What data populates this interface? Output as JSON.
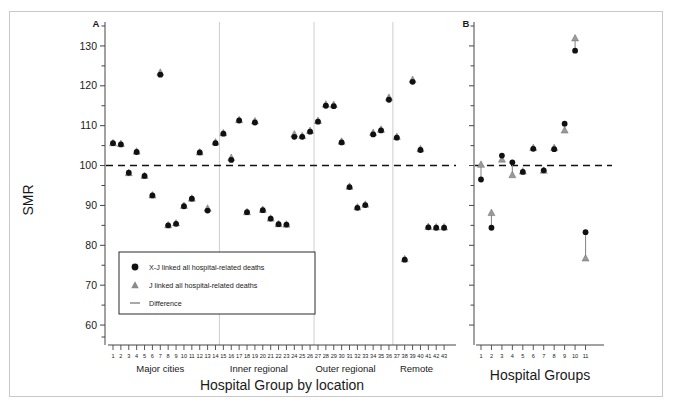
{
  "figure": {
    "background": "#ffffff",
    "frame_color": "#c9c9c9"
  },
  "axis": {
    "ylabel": "SMR",
    "ytick_labels": [
      "130",
      "120",
      "110",
      "100",
      "90",
      "80",
      "70",
      "60"
    ],
    "ytick_values": [
      130,
      120,
      110,
      100,
      90,
      80,
      70,
      60
    ],
    "ylim": [
      55,
      136
    ],
    "reference_line_value": 100
  },
  "panels": [
    {
      "letter": "A",
      "xlabel": "Hospital Group by location",
      "group_labels": [
        "Major cities",
        "Inner regional",
        "Outer regional",
        "Remote"
      ],
      "xtick_labels": [
        "1",
        "2",
        "3",
        "4",
        "5",
        "6",
        "7",
        "8",
        "9",
        "10",
        "11",
        "12",
        "13",
        "14",
        "15",
        "16",
        "17",
        "18",
        "19",
        "20",
        "21",
        "22",
        "23",
        "24",
        "25",
        "26",
        "27",
        "28",
        "29",
        "30",
        "31",
        "32",
        "33",
        "34",
        "35",
        "36",
        "37",
        "38",
        "39",
        "40",
        "41",
        "42",
        "43"
      ]
    },
    {
      "letter": "B",
      "xlabel": "Hospital Groups",
      "xtick_labels": [
        "1",
        "2",
        "3",
        "4",
        "5",
        "6",
        "7",
        "8",
        "9",
        "10",
        "11"
      ]
    }
  ],
  "legend": {
    "items": [
      {
        "marker": "circle",
        "color": "#111111",
        "label": "X-J linked all hospital-related deaths"
      },
      {
        "marker": "triangle",
        "color": "#8a8a8a",
        "label": "J linked all hospital-related deaths"
      },
      {
        "marker": "line",
        "color": "#7a7a7a",
        "label": "Difference"
      }
    ]
  },
  "colors": {
    "circle_marker": "#111111",
    "triangle_marker": "#9a9a9a",
    "difference_line": "#8c8c8c",
    "reference_line": "#111111",
    "separator_line": "#cfcfcf",
    "axis_line": "#444444"
  },
  "chart_data": {
    "type": "scatter",
    "title": "",
    "ylabel": "SMR",
    "ylim": [
      55,
      136
    ],
    "grid": false,
    "reference_line": 100,
    "legend_position": "lower-left-panel-A",
    "series": [
      {
        "name": "X-J linked all hospital-related deaths",
        "marker": "circle",
        "color": "#111111"
      },
      {
        "name": "J linked all hospital-related deaths",
        "marker": "triangle",
        "color": "#9a9a9a"
      }
    ],
    "panels": [
      {
        "panel": "A",
        "xlabel": "Hospital Group by location",
        "x": [
          1,
          2,
          3,
          4,
          5,
          6,
          7,
          8,
          9,
          10,
          11,
          12,
          13,
          14,
          15,
          16,
          17,
          18,
          19,
          20,
          21,
          22,
          23,
          24,
          25,
          26,
          27,
          28,
          29,
          30,
          31,
          32,
          33,
          34,
          35,
          36,
          37,
          38,
          39,
          40,
          41,
          42,
          43
        ],
        "groups": [
          {
            "label": "Major cities",
            "from": 1,
            "to": 13
          },
          {
            "label": "Inner regional",
            "from": 14,
            "to": 25
          },
          {
            "label": "Outer regional",
            "from": 26,
            "to": 35
          },
          {
            "label": "Remote",
            "from": 36,
            "to": 43
          }
        ],
        "xj_values": [
          105.6,
          105.3,
          98.2,
          103.4,
          97.4,
          92.5,
          122.8,
          85.0,
          85.4,
          89.8,
          91.7,
          103.3,
          88.7,
          105.6,
          108.0,
          101.4,
          111.3,
          88.3,
          110.8,
          88.8,
          86.7,
          85.3,
          85.2,
          107.2,
          107.2,
          108.5,
          111.0,
          115.0,
          114.9,
          105.8,
          94.6,
          89.4,
          90.1,
          107.8,
          108.8,
          116.5,
          107.0,
          76.4,
          121.0,
          103.9,
          84.5,
          84.4,
          84.4
        ],
        "j_values": [
          105.7,
          105.5,
          98.2,
          103.6,
          97.5,
          92.6,
          123.4,
          85.1,
          85.6,
          90.0,
          91.8,
          103.4,
          89.3,
          105.9,
          108.2,
          102.0,
          111.5,
          88.4,
          111.2,
          89.0,
          86.8,
          85.4,
          85.3,
          107.9,
          107.5,
          108.8,
          111.3,
          115.4,
          115.3,
          106.1,
          94.8,
          89.6,
          90.3,
          108.3,
          109.1,
          117.1,
          107.3,
          76.6,
          121.6,
          104.2,
          84.7,
          84.6,
          84.6
        ]
      },
      {
        "panel": "B",
        "xlabel": "Hospital Groups",
        "x": [
          1,
          2,
          3,
          4,
          5,
          6,
          7,
          8,
          9,
          10,
          11
        ],
        "xj_values": [
          96.5,
          84.4,
          102.5,
          100.8,
          98.4,
          104.2,
          98.8,
          104.1,
          110.5,
          128.8,
          83.3
        ],
        "j_values": [
          100.3,
          88.2,
          101.6,
          97.7,
          98.6,
          104.5,
          98.8,
          104.5,
          108.9,
          132.0,
          76.8
        ]
      }
    ]
  }
}
